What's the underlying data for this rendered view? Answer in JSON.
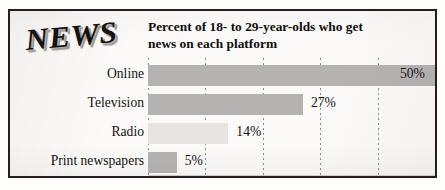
{
  "figure": {
    "logo_text": "NEWS",
    "title_line_1": "Percent of 18- to 29-year-olds who get",
    "title_line_2": "news on each platform",
    "colors": {
      "bar": "#b5b3b1",
      "bar_faint": "#e6e5e2",
      "frame": "#231f1d",
      "text": "#15120f",
      "background": "#fbfaf8",
      "gridline": "#8d8a86"
    }
  },
  "chart_data": {
    "type": "bar",
    "orientation": "horizontal",
    "title": "Percent of 18- to 29-year-olds who get news on each platform",
    "xlabel": "",
    "ylabel": "",
    "xlim": [
      0,
      50
    ],
    "grid": true,
    "gridlines_at": [
      0,
      10,
      20,
      30,
      40,
      50
    ],
    "legend": "none",
    "categories": [
      "Online",
      "Television",
      "Radio",
      "Print newspapers"
    ],
    "values": [
      50,
      27,
      14,
      5
    ],
    "value_labels": [
      "50%",
      "27%",
      "14%",
      "5%"
    ],
    "bars": [
      {
        "label": "Online",
        "value": 50,
        "value_label": "50%",
        "label_position": "inside"
      },
      {
        "label": "Television",
        "value": 27,
        "value_label": "27%",
        "label_position": "outside"
      },
      {
        "label": "Radio",
        "value": 14,
        "value_label": "14%",
        "label_position": "outside"
      },
      {
        "label": "Print newspapers",
        "value": 5,
        "value_label": "5%",
        "label_position": "outside"
      }
    ]
  }
}
